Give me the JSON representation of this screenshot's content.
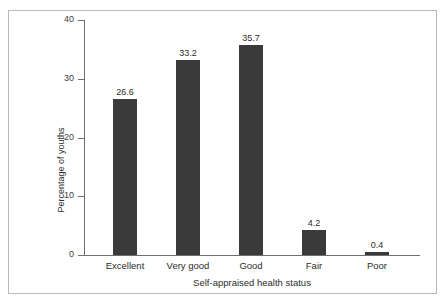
{
  "chart_data": {
    "type": "bar",
    "title": "",
    "subtitle": "",
    "xlabel": "Self-appraised health status",
    "ylabel": "Percentage of youths",
    "categories": [
      "Excellent",
      "Very good",
      "Good",
      "Fair",
      "Poor"
    ],
    "values": [
      26.6,
      33.2,
      35.7,
      4.2,
      0.4
    ],
    "value_labels": [
      "26.6",
      "33.2",
      "35.7",
      "4.2",
      "0.4"
    ],
    "ylim": [
      0,
      40
    ],
    "yticks": [
      0,
      10,
      20,
      30,
      40
    ],
    "ytick_labels": [
      "0",
      "10",
      "20",
      "30",
      "40"
    ],
    "grid": false,
    "legend": null,
    "bar_color": "#3a3a3a",
    "axis_color": "#6f6f6f",
    "background_color": "#ffffff",
    "frame_color": "#b9b9b9",
    "annotations": []
  },
  "figure": {
    "border_present": true
  }
}
